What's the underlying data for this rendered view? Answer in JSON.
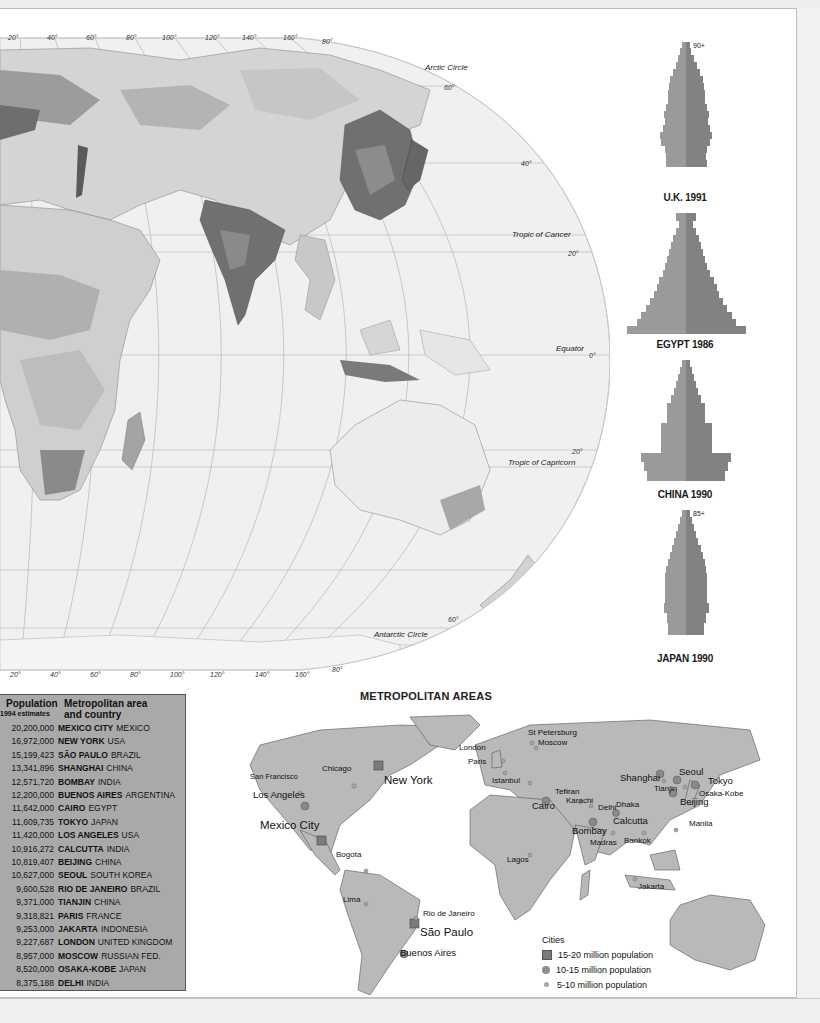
{
  "world_map": {
    "top_longitudes": [
      "20°",
      "40°",
      "60°",
      "80°",
      "100°",
      "120°",
      "140°",
      "160°",
      "80°"
    ],
    "bottom_longitudes": [
      "20°",
      "40°",
      "60°",
      "80°",
      "100°",
      "120°",
      "140°",
      "160°",
      "80°"
    ],
    "latitude_labels": {
      "lat60n": "60°",
      "lat40n": "40°",
      "lat20n": "20°",
      "lat0": "0°",
      "lat20s": "20°",
      "lat60s": "60°"
    },
    "lines": {
      "arctic": "Arctic Circle",
      "cancer": "Tropic of Cancer",
      "equator": "Equator",
      "capricorn": "Tropic of Capricorn",
      "antarctic": "Antarctic Circle"
    }
  },
  "pyramids": [
    {
      "title": "U.K. 1991",
      "top_label": "90+"
    },
    {
      "title": "EGYPT 1986",
      "top_label": ""
    },
    {
      "title": "CHINA 1990",
      "top_label": ""
    },
    {
      "title": "JAPAN 1990",
      "top_label": "85+"
    }
  ],
  "population_table": {
    "header_population": "Population",
    "header_sub": "1994 estimates",
    "header_area_line1": "Metropolitan area",
    "header_area_line2": "and country",
    "rows": [
      {
        "population": "20,200,000",
        "city": "MEXICO CITY",
        "country": "MEXICO"
      },
      {
        "population": "16,972,000",
        "city": "NEW YORK",
        "country": "USA"
      },
      {
        "population": "15,199,423",
        "city": "SÃO PAULO",
        "country": "BRAZIL"
      },
      {
        "population": "13,341,896",
        "city": "SHANGHAI",
        "country": "CHINA"
      },
      {
        "population": "12,571,720",
        "city": "BOMBAY",
        "country": "INDIA"
      },
      {
        "population": "12,200,000",
        "city": "BUENOS AIRES",
        "country": "ARGENTINA"
      },
      {
        "population": "11,642,000",
        "city": "CAIRO",
        "country": "EGYPT"
      },
      {
        "population": "11,609,735",
        "city": "TOKYO",
        "country": "JAPAN"
      },
      {
        "population": "11,420,000",
        "city": "LOS ANGELES",
        "country": "USA"
      },
      {
        "population": "10,916,272",
        "city": "CALCUTTA",
        "country": "INDIA"
      },
      {
        "population": "10,819,407",
        "city": "BEIJING",
        "country": "CHINA"
      },
      {
        "population": "10,627,000",
        "city": "SEOUL",
        "country": "SOUTH KOREA"
      },
      {
        "population": "9,600,528",
        "city": "RIO DE JANEIRO",
        "country": "BRAZIL"
      },
      {
        "population": "9,371,000",
        "city": "TIANJIN",
        "country": "CHINA"
      },
      {
        "population": "9,318,821",
        "city": "PARIS",
        "country": "FRANCE"
      },
      {
        "population": "9,253,000",
        "city": "JAKARTA",
        "country": "INDONESIA"
      },
      {
        "population": "9,227,687",
        "city": "LONDON",
        "country": "UNITED KINGDOM"
      },
      {
        "population": "8,957,000",
        "city": "MOSCOW",
        "country": "RUSSIAN FED."
      },
      {
        "population": "8,520,000",
        "city": "OSAKA-KOBE",
        "country": "JAPAN"
      },
      {
        "population": "8,375,188",
        "city": "DELHI",
        "country": "INDIA"
      }
    ]
  },
  "metro_map": {
    "title": "METROPOLITAN AREAS",
    "cities": {
      "new_york": "New York",
      "mexico_city": "Mexico City",
      "sao_paulo": "São Paulo",
      "los_angeles": "Los Angeles",
      "san_francisco": "San Francisco",
      "chicago": "Chicago",
      "london": "London",
      "paris": "Paris",
      "st_petersburg": "St Petersburg",
      "moscow": "Moscow",
      "istanbul": "Istanbul",
      "cairo": "Cairo",
      "tehran": "Tehran",
      "karachi": "Karachi",
      "delhi": "Delhi",
      "dhaka": "Dhaka",
      "calcutta": "Calcutta",
      "bombay": "Bombay",
      "madras": "Madras",
      "bangkok": "Bankok",
      "shanghai": "Shanghai",
      "tianjin": "Tianjin",
      "seoul": "Seoul",
      "tokyo": "Tokyo",
      "osaka_kobe": "Osaka-Kobe",
      "beijing": "Beijing",
      "manila": "Manila",
      "jakarta": "Jakarta",
      "lagos": "Lagos",
      "bogota": "Bogota",
      "lima": "Lima",
      "rio": "Rio de Janeiro",
      "buenos_aires": "Buenos Aires"
    },
    "legend": {
      "title": "Cities",
      "items": [
        "15-20 million population",
        "10-15 million population",
        "5-10 million population"
      ]
    }
  }
}
